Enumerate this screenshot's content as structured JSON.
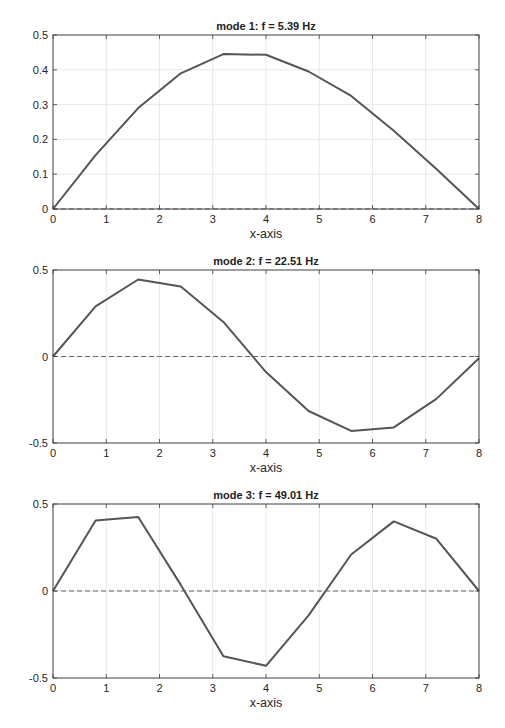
{
  "figure": {
    "width": 505,
    "height": 728,
    "colors": {
      "line": "#555555",
      "zero_line": "#666666",
      "axis": "#3a3a3a",
      "grid": "#e3e3e3",
      "text": "#262626"
    }
  },
  "chart_data": [
    {
      "type": "line",
      "title": "mode 1: f = 5.39 Hz",
      "xlabel": "x-axis",
      "ylabel": "",
      "xlim": [
        0,
        8
      ],
      "ylim": [
        0,
        0.5
      ],
      "xticks": [
        0,
        1,
        2,
        3,
        4,
        5,
        6,
        7,
        8
      ],
      "xtick_labels": [
        "0",
        "1",
        "2",
        "3",
        "4",
        "5",
        "6",
        "7",
        "8"
      ],
      "yticks": [
        0,
        0.1,
        0.2,
        0.3,
        0.4,
        0.5
      ],
      "ytick_labels": [
        "0",
        "0.1",
        "0.2",
        "0.3",
        "0.4",
        "0.5"
      ],
      "grid": true,
      "x": [
        0,
        0.8,
        1.6,
        2.4,
        3.2,
        4.0,
        4.8,
        5.6,
        6.4,
        7.2,
        8.0
      ],
      "series": [
        {
          "name": "mode shape",
          "style": "solid",
          "values": [
            0,
            0.155,
            0.29,
            0.39,
            0.445,
            0.443,
            0.395,
            0.325,
            0.225,
            0.115,
            0
          ]
        },
        {
          "name": "zero line",
          "style": "dashed",
          "values": [
            0,
            0,
            0,
            0,
            0,
            0,
            0,
            0,
            0,
            0,
            0
          ]
        }
      ],
      "box": {
        "left": 53,
        "top": 35,
        "right": 479,
        "bottom": 209
      }
    },
    {
      "type": "line",
      "title": "mode 2: f = 22.51 Hz",
      "xlabel": "x-axis",
      "ylabel": "",
      "xlim": [
        0,
        8
      ],
      "ylim": [
        -0.5,
        0.5
      ],
      "xticks": [
        0,
        1,
        2,
        3,
        4,
        5,
        6,
        7,
        8
      ],
      "xtick_labels": [
        "0",
        "1",
        "2",
        "3",
        "4",
        "5",
        "6",
        "7",
        "8"
      ],
      "yticks": [
        -0.5,
        0,
        0.5
      ],
      "ytick_labels": [
        "-0.5",
        "0",
        "0.5"
      ],
      "grid": true,
      "x": [
        0,
        0.8,
        1.6,
        2.4,
        3.2,
        4.0,
        4.8,
        5.6,
        6.4,
        7.2,
        8.0
      ],
      "series": [
        {
          "name": "mode shape",
          "style": "solid",
          "values": [
            0,
            0.29,
            0.445,
            0.405,
            0.2,
            -0.09,
            -0.315,
            -0.43,
            -0.41,
            -0.245,
            -0.01
          ]
        },
        {
          "name": "zero line",
          "style": "dashed",
          "values": [
            0,
            0,
            0,
            0,
            0,
            0,
            0,
            0,
            0,
            0,
            0
          ]
        }
      ],
      "box": {
        "left": 53,
        "top": 270,
        "right": 479,
        "bottom": 443
      }
    },
    {
      "type": "line",
      "title": "mode 3: f = 49.01 Hz",
      "xlabel": "x-axis",
      "ylabel": "",
      "xlim": [
        0,
        8
      ],
      "ylim": [
        -0.5,
        0.5
      ],
      "xticks": [
        0,
        1,
        2,
        3,
        4,
        5,
        6,
        7,
        8
      ],
      "xtick_labels": [
        "0",
        "1",
        "2",
        "3",
        "4",
        "5",
        "6",
        "7",
        "8"
      ],
      "yticks": [
        -0.5,
        0,
        0.5
      ],
      "ytick_labels": [
        "-0.5",
        "0",
        "0.5"
      ],
      "grid": true,
      "x": [
        0,
        0.8,
        1.6,
        2.4,
        3.2,
        4.0,
        4.8,
        5.6,
        6.4,
        7.2,
        8.0
      ],
      "series": [
        {
          "name": "mode shape",
          "style": "solid",
          "values": [
            0,
            0.405,
            0.425,
            0.035,
            -0.375,
            -0.43,
            -0.14,
            0.21,
            0.4,
            0.3,
            0
          ]
        },
        {
          "name": "zero line",
          "style": "dashed",
          "values": [
            0,
            0,
            0,
            0,
            0,
            0,
            0,
            0,
            0,
            0,
            0
          ]
        }
      ],
      "box": {
        "left": 53,
        "top": 504,
        "right": 479,
        "bottom": 678
      }
    }
  ]
}
